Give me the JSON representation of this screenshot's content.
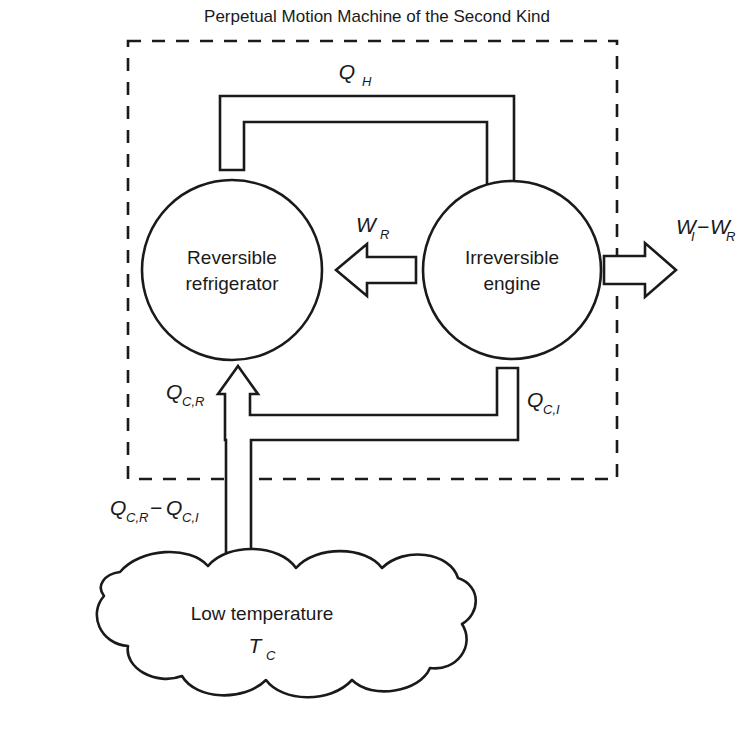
{
  "title": "Perpetual Motion Machine of the Second Kind",
  "boundary": {
    "name": "system-boundary",
    "style": "dashed"
  },
  "nodes": [
    {
      "id": "reversible-refrigerator",
      "line1": "Reversible",
      "line2": "refrigerator",
      "shape": "circle"
    },
    {
      "id": "irreversible-engine",
      "line1": "Irreversible",
      "line2": "engine",
      "shape": "circle"
    }
  ],
  "reservoir": {
    "id": "low-temperature-reservoir",
    "line1": "Low temperature",
    "symbol": "T",
    "subscript": "C",
    "shape": "cloud"
  },
  "flows": {
    "qh": {
      "symbol": "Q",
      "subscript": "H",
      "direction": "refrigerator-to-engine",
      "kind": "heat"
    },
    "wr": {
      "symbol": "W",
      "subscript": "R",
      "direction": "engine-to-refrigerator",
      "kind": "work"
    },
    "w_net": {
      "symbol_1": "W",
      "subscript_1": "I",
      "operator": "−",
      "symbol_2": "W",
      "subscript_2": "R",
      "direction": "out-of-system",
      "kind": "work"
    },
    "qcr": {
      "symbol": "Q",
      "subscript": "C,R",
      "direction": "into-refrigerator",
      "kind": "heat"
    },
    "qci": {
      "symbol": "Q",
      "subscript": "C,I",
      "direction": "out-of-engine",
      "kind": "heat"
    },
    "qc_net": {
      "symbol_1": "Q",
      "subscript_1": "C,R",
      "operator": "−",
      "symbol_2": "Q",
      "subscript_2": "C,I",
      "direction": "from-reservoir",
      "kind": "heat"
    }
  },
  "colors": {
    "ink": "#1a1a1a",
    "paper": "#ffffff"
  }
}
